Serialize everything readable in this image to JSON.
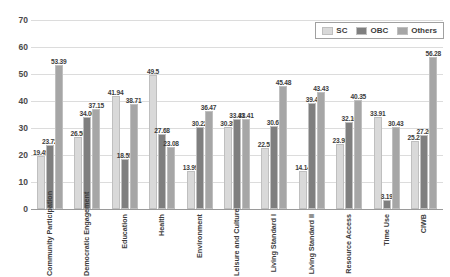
{
  "chart_data": {
    "type": "bar",
    "title": "",
    "xlabel": "",
    "ylabel": "",
    "ylim": [
      0,
      70
    ],
    "yticks": [
      0,
      10,
      20,
      30,
      40,
      50,
      60,
      70
    ],
    "grid": true,
    "legend_position": "top-right",
    "categories": [
      "Community Participation",
      "Democratic Engagement",
      "Education",
      "Health",
      "Environment",
      "Leisure and Culture",
      "Living Standard I",
      "Living Standard II",
      "Resource Access",
      "Time Use",
      "CIWB"
    ],
    "series": [
      {
        "name": "SC",
        "color": "#d9d9d9",
        "values": [
          19.49,
          26.56,
          41.94,
          49.5,
          13.99,
          30.39,
          22.58,
          14.14,
          23.98,
          33.91,
          25.22
        ]
      },
      {
        "name": "OBC",
        "color": "#7f7f7f",
        "values": [
          23.72,
          34.06,
          18.55,
          27.68,
          30.22,
          33.41,
          30.65,
          39.4,
          32.16,
          3.19,
          27.26
        ]
      },
      {
        "name": "Others",
        "color": "#a6a6a6",
        "values": [
          53.39,
          37.15,
          38.71,
          23.08,
          36.47,
          33.41,
          45.48,
          43.43,
          40.35,
          30.43,
          56.28
        ]
      }
    ]
  },
  "legend": {
    "items": [
      {
        "label": "SC"
      },
      {
        "label": "OBC"
      },
      {
        "label": "Others"
      }
    ]
  }
}
